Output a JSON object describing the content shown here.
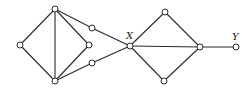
{
  "diagram": {
    "type": "graph",
    "nodes": [
      {
        "id": "L",
        "x": 20,
        "y": 45,
        "label": ""
      },
      {
        "id": "T",
        "x": 55,
        "y": 9,
        "label": ""
      },
      {
        "id": "B",
        "x": 55,
        "y": 81,
        "label": ""
      },
      {
        "id": "M",
        "x": 89,
        "y": 45,
        "label": ""
      },
      {
        "id": "U",
        "x": 92,
        "y": 28,
        "label": ""
      },
      {
        "id": "D",
        "x": 92,
        "y": 63,
        "label": ""
      },
      {
        "id": "X",
        "x": 130,
        "y": 46,
        "label": "X"
      },
      {
        "id": "RT",
        "x": 165,
        "y": 12,
        "label": ""
      },
      {
        "id": "RB",
        "x": 164,
        "y": 81,
        "label": ""
      },
      {
        "id": "R",
        "x": 200,
        "y": 47,
        "label": ""
      },
      {
        "id": "Y",
        "x": 236,
        "y": 47,
        "label": "Y"
      }
    ],
    "edges": [
      [
        "L",
        "T"
      ],
      [
        "L",
        "B"
      ],
      [
        "T",
        "B"
      ],
      [
        "T",
        "M"
      ],
      [
        "B",
        "M"
      ],
      [
        "T",
        "U"
      ],
      [
        "U",
        "X"
      ],
      [
        "B",
        "D"
      ],
      [
        "D",
        "X"
      ],
      [
        "X",
        "RT"
      ],
      [
        "X",
        "RB"
      ],
      [
        "X",
        "R"
      ],
      [
        "RT",
        "R"
      ],
      [
        "RB",
        "R"
      ],
      [
        "R",
        "Y"
      ]
    ],
    "labels": [
      {
        "text": "X",
        "x": 126,
        "y": 39
      },
      {
        "text": "Y",
        "x": 232,
        "y": 40
      }
    ]
  }
}
